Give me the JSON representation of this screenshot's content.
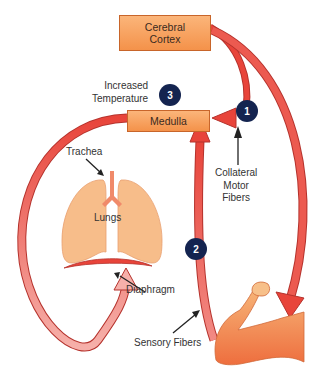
{
  "diagram": {
    "nodes": {
      "cerebral_cortex": {
        "line1": "Cerebral",
        "line2": "Cortex"
      },
      "medulla": {
        "label": "Medulla"
      }
    },
    "labels": {
      "increased_temperature": {
        "line1": "Increased",
        "line2": "Temperature"
      },
      "collateral_motor_fibers": {
        "line1": "Collateral",
        "line2": "Motor",
        "line3": "Fibers"
      },
      "trachea": "Trachea",
      "lungs": "Lungs",
      "diaphragm": "Diaphragm",
      "sensory_fibers": "Sensory Fibers"
    },
    "badges": [
      "1",
      "2",
      "3"
    ],
    "colors": {
      "box_fill": "#f4924a",
      "arrow_red": "#e8443a",
      "arrow_light": "#f4a0a0",
      "badge": "#142450",
      "organ": "#f7bd8a"
    }
  }
}
